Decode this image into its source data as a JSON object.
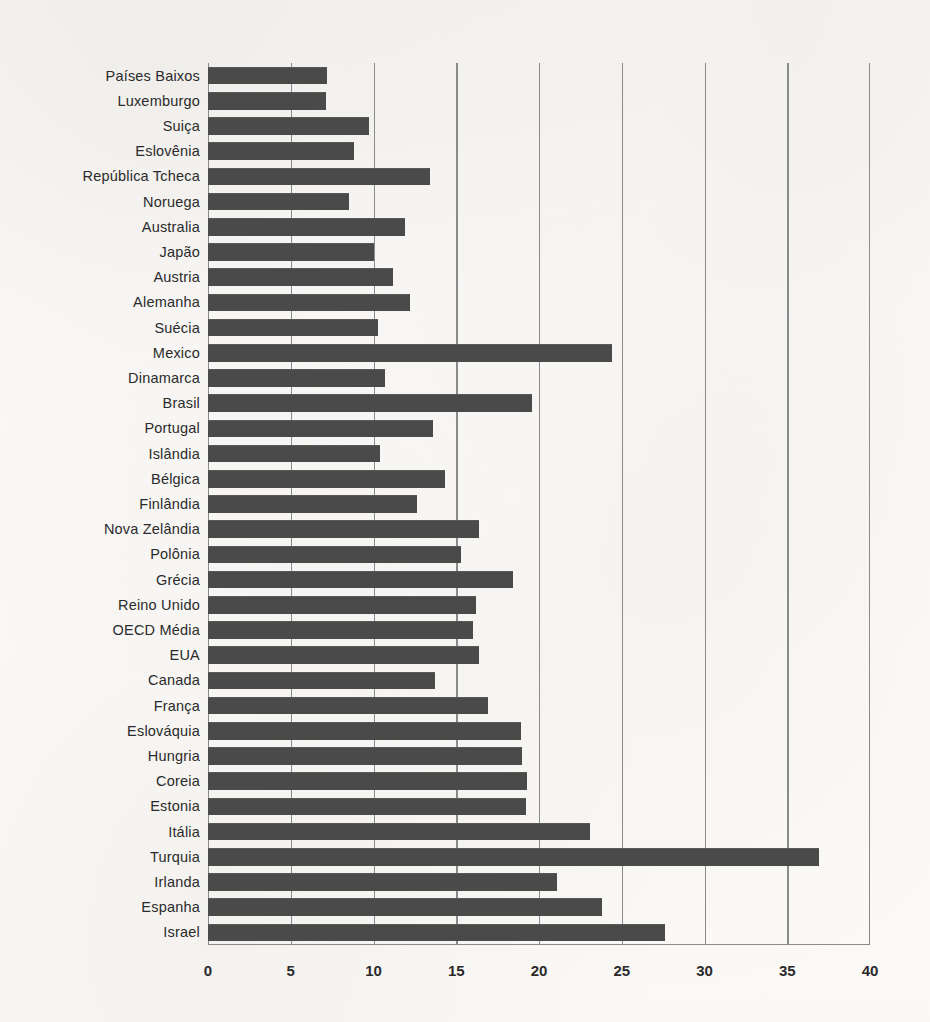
{
  "chart_data": {
    "type": "bar",
    "orientation": "horizontal",
    "title": "",
    "subtitle": "",
    "xlabel": "",
    "ylabel": "",
    "xlim": [
      0,
      40
    ],
    "xticks": [
      0,
      5,
      10,
      15,
      20,
      25,
      30,
      35,
      40
    ],
    "xtick_labels": [
      "0",
      "5",
      "10",
      "15",
      "20",
      "25",
      "30",
      "35",
      "40"
    ],
    "grid": true,
    "grid_axis": "x",
    "legend": false,
    "legend_position": "none",
    "bar_color": "#4a4a4a",
    "axis_color": "#8a8a8a",
    "background_color": "#faf9f6",
    "categories": [
      "Países Baixos",
      "Luxemburgo",
      "Suiça",
      "Eslovênia",
      "República Tcheca",
      "Noruega",
      "Australia",
      "Japão",
      "Austria",
      "Alemanha",
      "Suécia",
      "Mexico",
      "Dinamarca",
      "Brasil",
      "Portugal",
      "Islândia",
      "Bélgica",
      "Finlândia",
      "Nova Zelândia",
      "Polônia",
      "Grécia",
      "Reino Unido",
      "OECD Média",
      "EUA",
      "Canada",
      "França",
      "Eslováquia",
      "Hungria",
      "Coreia",
      "Estonia",
      "Itália",
      "Turquia",
      "Irlanda",
      "Espanha",
      "Israel"
    ],
    "values": [
      7.2,
      7.1,
      9.7,
      8.8,
      13.4,
      8.5,
      11.9,
      10.0,
      11.2,
      12.2,
      10.3,
      24.4,
      10.7,
      19.6,
      13.6,
      10.4,
      14.3,
      12.6,
      16.4,
      15.3,
      18.4,
      16.2,
      16.0,
      16.4,
      13.7,
      16.9,
      18.9,
      19.0,
      19.3,
      19.2,
      23.1,
      36.9,
      21.1,
      23.8,
      27.6
    ]
  }
}
